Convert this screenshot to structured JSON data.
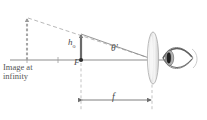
{
  "figure": {
    "domain": "diagram",
    "background_color": "#ffffff",
    "stroke_color": "#8a8a8a",
    "dash_color": "#a9a9a9",
    "text_color": "#4b4b4b",
    "labels": {
      "image_at_infinity": "Image at infinity",
      "image_at_infinity_line1": "Image at",
      "image_at_infinity_line2": "infinity",
      "object_height": "h",
      "object_height_subscript": "o",
      "focal_point": "F",
      "angle": "θ′",
      "focal_length": "f"
    },
    "elements": [
      {
        "name": "optical-axis",
        "type": "line",
        "x1": 10,
        "y1": 60,
        "x2": 170,
        "y2": 60
      },
      {
        "name": "virtual-image-arrow",
        "type": "dashed-arrow-up",
        "x": 27,
        "y_base": 60,
        "y_tip": 17
      },
      {
        "name": "object-arrow",
        "type": "arrow-up",
        "x": 81,
        "y_base": 60,
        "y_tip": 33
      },
      {
        "name": "focal-point-dot",
        "type": "dot",
        "x": 81,
        "y": 60
      },
      {
        "name": "upper-ray-dashed",
        "type": "dashed-line",
        "x1": 28,
        "y1": 18,
        "x2": 152,
        "y2": 59
      },
      {
        "name": "chief-ray",
        "type": "line",
        "x1": 81,
        "y1": 34,
        "x2": 152,
        "y2": 59
      },
      {
        "name": "lens",
        "type": "ellipse",
        "cx": 153,
        "cy": 58,
        "rx": 5.5,
        "ry": 26
      },
      {
        "name": "eye",
        "type": "eye-shape",
        "cx": 176,
        "cy": 58
      },
      {
        "name": "dimension-line-f",
        "type": "double-arrow",
        "x1": 81,
        "x2": 152,
        "y": 100
      },
      {
        "name": "extension-line-left",
        "type": "dashed-line",
        "x1": 81,
        "y1": 62,
        "x2": 81,
        "y2": 108
      },
      {
        "name": "extension-line-right",
        "type": "dashed-line",
        "x1": 152,
        "y1": 62,
        "x2": 152,
        "y2": 108
      },
      {
        "name": "ground-tick-left",
        "type": "tick",
        "x": 27,
        "y": 60
      },
      {
        "name": "ground-tick-mid",
        "type": "tick",
        "x": 58,
        "y": 60
      }
    ]
  }
}
